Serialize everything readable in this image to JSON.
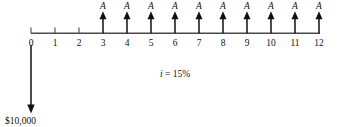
{
  "diagram": {
    "type": "cash-flow-diagram",
    "interest_rate_label": "i = 15%",
    "interest_rate_symbol": "i",
    "interest_rate_equals": " = ",
    "interest_rate_value": "15%",
    "timeline": {
      "start_period": 0,
      "end_period": 12,
      "tick_labels": [
        "0",
        "1",
        "2",
        "3",
        "4",
        "5",
        "6",
        "7",
        "8",
        "9",
        "10",
        "11",
        "12"
      ]
    },
    "inflows": [
      {
        "period": "3",
        "label": "A"
      },
      {
        "period": "4",
        "label": "A"
      },
      {
        "period": "5",
        "label": "A"
      },
      {
        "period": "6",
        "label": "A"
      },
      {
        "period": "7",
        "label": "A"
      },
      {
        "period": "8",
        "label": "A"
      },
      {
        "period": "9",
        "label": "A"
      },
      {
        "period": "10",
        "label": "A"
      },
      {
        "period": "11",
        "label": "A"
      },
      {
        "period": "12",
        "label": "A"
      }
    ],
    "outflow": {
      "period": "0",
      "amount_label": "$10,000"
    },
    "colors": {
      "axis": "#4a4a4a",
      "arrow": "#111111",
      "text": "#111111",
      "background": "#ffffff"
    }
  }
}
